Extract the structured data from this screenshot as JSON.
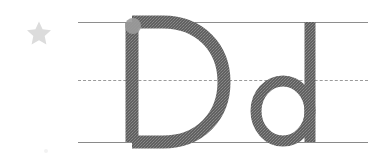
{
  "worksheet": {
    "title": "Letter Dd Handwriting Practice",
    "letter_uppercase": "D",
    "letter_lowercase": "d",
    "letter_pair": "Dd",
    "background_color": "#ffffff"
  },
  "star": {
    "name": "star-marker",
    "label": "star",
    "color": "#dcdcdc",
    "points": 5
  },
  "guide_lines": {
    "top": {
      "label": "top line",
      "style": "solid",
      "color": "#8e8e8e",
      "y": 22
    },
    "middle": {
      "label": "midline",
      "style": "dashed",
      "color": "#9a9a9a",
      "y": 80
    },
    "bottom": {
      "label": "baseline",
      "style": "solid",
      "color": "#8a8a8a",
      "y": 142
    },
    "x_start": 78,
    "x_end": 368
  },
  "glyphs": {
    "uppercase": {
      "character": "D",
      "color": "#5e5e5e",
      "stroke_width": 13,
      "start_dot": {
        "label": "start point",
        "color": "#9b9b9b",
        "x": 132,
        "y": 26,
        "radius": 8
      }
    },
    "lowercase": {
      "character": "d",
      "color": "#5e5e5e",
      "stroke_width": 11
    }
  }
}
